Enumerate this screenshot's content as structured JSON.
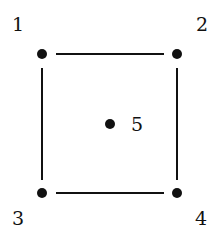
{
  "diagram": {
    "type": "graph",
    "nodes": [
      {
        "id": "1",
        "label": "1",
        "x": 42,
        "y": 54,
        "lx": 12,
        "ly": 31
      },
      {
        "id": "2",
        "label": "2",
        "x": 177,
        "y": 54,
        "lx": 196,
        "ly": 31
      },
      {
        "id": "3",
        "label": "3",
        "x": 42,
        "y": 193,
        "lx": 12,
        "ly": 225
      },
      {
        "id": "4",
        "label": "4",
        "x": 177,
        "y": 193,
        "lx": 195,
        "ly": 225
      },
      {
        "id": "5",
        "label": "5",
        "x": 110,
        "y": 124,
        "lx": 131,
        "ly": 131
      }
    ],
    "edges": [
      [
        "1",
        "2"
      ],
      [
        "2",
        "4"
      ],
      [
        "4",
        "3"
      ],
      [
        "3",
        "1"
      ]
    ],
    "colors": {
      "ink": "#111111",
      "background": "#ffffff"
    }
  }
}
